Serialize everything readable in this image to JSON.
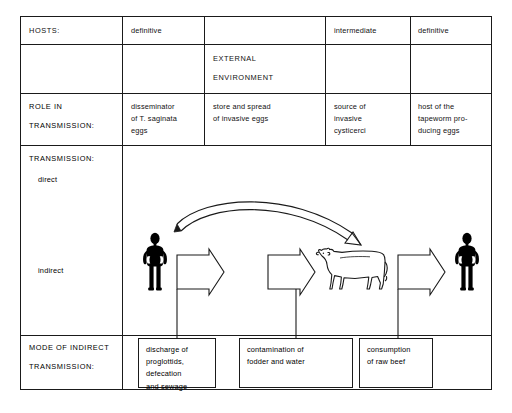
{
  "diagram": {
    "columns": [
      {
        "key": "rowlabel",
        "header": ""
      },
      {
        "key": "human_definitive_left",
        "header": "definitive"
      },
      {
        "key": "environment",
        "header": ""
      },
      {
        "key": "cattle_intermediate",
        "header": "intermediate"
      },
      {
        "key": "human_definitive_right",
        "header": "definitive"
      }
    ],
    "rows": {
      "hosts": {
        "label": "HOSTS:",
        "cells": [
          "definitive",
          "",
          "intermediate",
          "definitive"
        ]
      },
      "environment": {
        "label": "",
        "external_environment_line1": "EXTERNAL",
        "external_environment_line2": "ENVIRONMENT"
      },
      "role": {
        "label_line1": "ROLE IN",
        "label_line2": "TRANSMISSION:",
        "cells": [
          "disseminator\nof T. saginata\neggs",
          "store and spread\nof invasive eggs",
          "source of\ninvasive\ncysticerci",
          "host of the\ntapeworm pro-\nducing eggs"
        ]
      },
      "transmission": {
        "label": "TRANSMISSION:",
        "direct_label": "direct",
        "indirect_label": "indirect"
      },
      "mode": {
        "label_line1": "MODE OF INDIRECT",
        "label_line2": "TRANSMISSION:",
        "boxes": [
          "discharge of\nproglottids,\ndefecation\nand sewage",
          "contamination of\nfodder and water",
          "consumption\nof raw beef"
        ]
      }
    },
    "figures": [
      {
        "name": "human-silhouette-left",
        "kind": "human",
        "fill": "#000000"
      },
      {
        "name": "cow-outline",
        "kind": "cow",
        "fill": "#ffffff",
        "stroke": "#000000"
      },
      {
        "name": "human-silhouette-right",
        "kind": "human",
        "fill": "#000000"
      }
    ],
    "block_arrows": [
      {
        "name": "block-arrow-human-to-environment"
      },
      {
        "name": "block-arrow-environment-to-cattle"
      },
      {
        "name": "block-arrow-cattle-to-human"
      }
    ],
    "curved_arrow": {
      "name": "direct-transmission-arrow",
      "from": "human-silhouette-left",
      "to": "cow-outline"
    },
    "colors": {
      "line": "#1a1a1a",
      "text": "#111111",
      "background": "#ffffff",
      "figure_fill": "#000000"
    }
  }
}
